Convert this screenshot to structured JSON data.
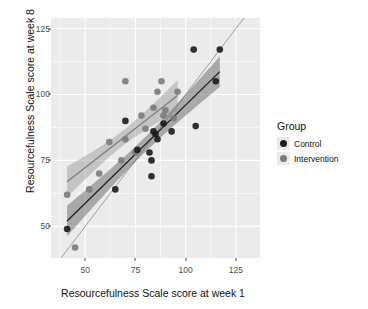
{
  "chart_data": {
    "type": "scatter",
    "title": "",
    "xlabel": "Resourcefulness Scale score at week 1",
    "ylabel": "Resourcefulness Scale score at week 8",
    "xlim": [
      33,
      137
    ],
    "ylim": [
      38,
      129
    ],
    "xticks": [
      50,
      75,
      100,
      125
    ],
    "yticks": [
      50,
      75,
      100,
      125
    ],
    "grid": true,
    "grid_color": "#ffffff",
    "panel_background": "#ebebeb",
    "legend": {
      "title": "Group",
      "position": "right",
      "entries": [
        {
          "name": "Control",
          "color": "#1a1a1a"
        },
        {
          "name": "Intervention",
          "color": "#7b7b7b"
        }
      ]
    },
    "reference_line": {
      "name": "identity-line",
      "slope": 1,
      "intercept": 0,
      "color": "#8c8c8c"
    },
    "series": [
      {
        "name": "Control",
        "color": "#1a1a1a",
        "points": [
          [
            41,
            49
          ],
          [
            65,
            64
          ],
          [
            70,
            90
          ],
          [
            76,
            79
          ],
          [
            82,
            78
          ],
          [
            83,
            75
          ],
          [
            83,
            69
          ],
          [
            84,
            86
          ],
          [
            85,
            85
          ],
          [
            86,
            83
          ],
          [
            89,
            89
          ],
          [
            93,
            86
          ],
          [
            104,
            117
          ],
          [
            105,
            88
          ],
          [
            115,
            105
          ],
          [
            117,
            117
          ]
        ],
        "fit": {
          "intercept": 21.5,
          "slope": 0.745,
          "xmin": 41,
          "xmax": 117
        },
        "ci_color": "#4d4d4d"
      },
      {
        "name": "Intervention",
        "color": "#7b7b7b",
        "points": [
          [
            41,
            62
          ],
          [
            45,
            42
          ],
          [
            52,
            64
          ],
          [
            57,
            70
          ],
          [
            62,
            82
          ],
          [
            68,
            75
          ],
          [
            70,
            83
          ],
          [
            70,
            105
          ],
          [
            75,
            78
          ],
          [
            78,
            92
          ],
          [
            80,
            87
          ],
          [
            84,
            95
          ],
          [
            86,
            101
          ],
          [
            88,
            105
          ],
          [
            89,
            92
          ],
          [
            90,
            94
          ],
          [
            94,
            91
          ],
          [
            96,
            101
          ]
        ],
        "fit": {
          "intercept": 42.5,
          "slope": 0.595,
          "xmin": 41,
          "xmax": 96
        },
        "ci_color": "#8f8f8f"
      }
    ]
  }
}
